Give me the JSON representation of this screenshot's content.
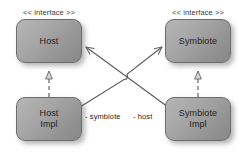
{
  "diagram": {
    "type": "uml-class-diagram",
    "background_color": "#ffffff",
    "node_fill_color": "#a6a6a6",
    "node_border_color": "#6d6d6d",
    "line_color": "#5a5a5a",
    "text_color": "#1e1e1e"
  },
  "nodes": {
    "host": {
      "name": "Host",
      "stereotype": "<< interface >>",
      "kind": "interface"
    },
    "symbiote": {
      "name": "Symbiote",
      "stereotype": "<< interface >>",
      "kind": "interface"
    },
    "host_impl": {
      "name": "Host\nImpl",
      "kind": "class"
    },
    "symbiote_impl": {
      "name": "Symbiote\nImpl",
      "kind": "class"
    }
  },
  "edges": {
    "realization_host": {
      "from": "host_impl",
      "to": "host",
      "kind": "realization",
      "style": "dashed",
      "arrowhead": "hollow-triangle",
      "label": ""
    },
    "realization_symbiote": {
      "from": "symbiote_impl",
      "to": "symbiote",
      "kind": "realization",
      "style": "dashed",
      "arrowhead": "hollow-triangle",
      "label": ""
    },
    "association_symbiote": {
      "from": "host_impl",
      "to": "symbiote",
      "kind": "association",
      "style": "solid",
      "arrowhead": "open-arrow",
      "label": "- symbiote"
    },
    "association_host": {
      "from": "symbiote_impl",
      "to": "host",
      "kind": "association",
      "style": "solid",
      "arrowhead": "open-arrow",
      "label": "- host"
    }
  }
}
